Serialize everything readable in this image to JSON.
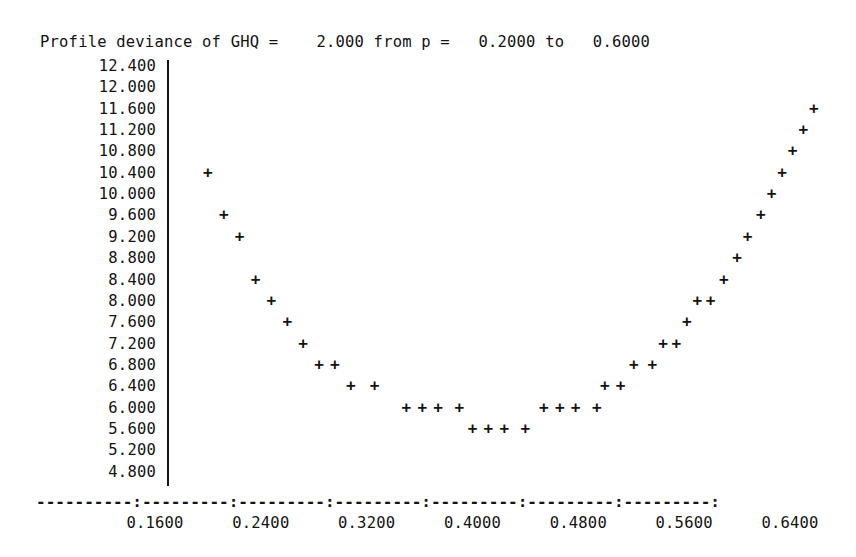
{
  "chart_data": {
    "type": "scatter",
    "title": "Profile deviance of GHQ =    2.000 from p =   0.2000 to   0.6000",
    "title_parts": {
      "prefix": "Profile deviance of GHQ =",
      "ghq_value": "2.000",
      "from_label": "from p =",
      "p_from": "0.2000",
      "to_label": "to",
      "p_to": "0.6000"
    },
    "xlabel": "",
    "ylabel": "",
    "xlim": [
      0.16,
      0.64
    ],
    "ylim": [
      4.8,
      12.4
    ],
    "grid": false,
    "legend": null,
    "marker": "+",
    "y_ticks": [
      "12.400",
      "12.000",
      "11.600",
      "11.200",
      "10.800",
      "10.400",
      "10.000",
      "9.600",
      "9.200",
      "8.800",
      "8.400",
      "8.000",
      "7.600",
      "7.200",
      "6.800",
      "6.400",
      "6.000",
      "5.600",
      "5.200",
      "4.800"
    ],
    "y_tick_values": [
      12.4,
      12.0,
      11.6,
      11.2,
      10.8,
      10.4,
      10.0,
      9.6,
      9.2,
      8.8,
      8.4,
      8.0,
      7.6,
      7.2,
      6.8,
      6.4,
      6.0,
      5.6,
      5.2,
      4.8
    ],
    "x_ticks": [
      "0.1600",
      "0.2400",
      "0.3200",
      "0.4000",
      "0.4800",
      "0.5600",
      "0.6400"
    ],
    "x_tick_values": [
      0.16,
      0.24,
      0.32,
      0.4,
      0.48,
      0.56,
      0.64
    ],
    "axis_rule": "----------:---------:---------:---------:---------:---------:---------:",
    "points": [
      {
        "x": 0.2,
        "y": 10.4
      },
      {
        "x": 0.212,
        "y": 9.6
      },
      {
        "x": 0.224,
        "y": 9.2
      },
      {
        "x": 0.236,
        "y": 8.4
      },
      {
        "x": 0.248,
        "y": 8.0
      },
      {
        "x": 0.26,
        "y": 7.6
      },
      {
        "x": 0.272,
        "y": 7.2
      },
      {
        "x": 0.284,
        "y": 6.8
      },
      {
        "x": 0.296,
        "y": 6.8
      },
      {
        "x": 0.308,
        "y": 6.4
      },
      {
        "x": 0.326,
        "y": 6.4
      },
      {
        "x": 0.35,
        "y": 6.0
      },
      {
        "x": 0.362,
        "y": 6.0
      },
      {
        "x": 0.374,
        "y": 6.0
      },
      {
        "x": 0.39,
        "y": 6.0
      },
      {
        "x": 0.4,
        "y": 5.6
      },
      {
        "x": 0.412,
        "y": 5.6
      },
      {
        "x": 0.424,
        "y": 5.6
      },
      {
        "x": 0.44,
        "y": 5.6
      },
      {
        "x": 0.454,
        "y": 6.0
      },
      {
        "x": 0.466,
        "y": 6.0
      },
      {
        "x": 0.478,
        "y": 6.0
      },
      {
        "x": 0.494,
        "y": 6.0
      },
      {
        "x": 0.5,
        "y": 6.4
      },
      {
        "x": 0.512,
        "y": 6.4
      },
      {
        "x": 0.522,
        "y": 6.8
      },
      {
        "x": 0.536,
        "y": 6.8
      },
      {
        "x": 0.544,
        "y": 7.2
      },
      {
        "x": 0.554,
        "y": 7.2
      },
      {
        "x": 0.562,
        "y": 7.6
      },
      {
        "x": 0.57,
        "y": 8.0
      },
      {
        "x": 0.58,
        "y": 8.0
      },
      {
        "x": 0.59,
        "y": 8.4
      },
      {
        "x": 0.6,
        "y": 8.8
      },
      {
        "x": 0.608,
        "y": 9.2
      },
      {
        "x": 0.618,
        "y": 9.6
      },
      {
        "x": 0.626,
        "y": 10.0
      },
      {
        "x": 0.634,
        "y": 10.4
      },
      {
        "x": 0.642,
        "y": 10.8
      },
      {
        "x": 0.65,
        "y": 11.2
      },
      {
        "x": 0.658,
        "y": 11.6
      }
    ]
  }
}
